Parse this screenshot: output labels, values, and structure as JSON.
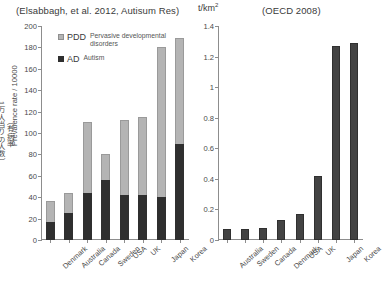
{
  "left": {
    "title": "(Elsabbagh, et al. 2012, Autisum Res)",
    "y_axis_label_en": "Prevalence rate / 10000",
    "y_axis_label_ja_1": "（有病率",
    "y_axis_label_ja_2": "1万人当りの人数）",
    "legend": [
      {
        "key": "PDD",
        "desc": "Pervasive developmental disorders",
        "color": "#b4b4b4"
      },
      {
        "key": "AD",
        "desc": "Autism",
        "color": "#2f2f2f"
      }
    ]
  },
  "right": {
    "title": "(OECD 2008)",
    "unit": "t/km2"
  },
  "chart_data": [
    {
      "type": "bar",
      "id": "prevalence",
      "title": "(Elsabbagh, et al. 2012, Autisum Res)",
      "xlabel": "",
      "ylabel": "Prevalence rate / 10000",
      "ylim": [
        0,
        200
      ],
      "yticks": [
        0,
        20,
        40,
        60,
        80,
        100,
        120,
        140,
        160,
        180,
        200
      ],
      "grid": false,
      "stacked": true,
      "legend_position": "top-left",
      "categories": [
        "Denmark",
        "Australia",
        "Canada",
        "Sweden",
        "USA",
        "UK",
        "Japan",
        "Korea"
      ],
      "series": [
        {
          "name": "AD",
          "label": "Autism",
          "color": "#2f2f2f",
          "values": [
            17,
            25,
            44,
            56,
            42,
            42,
            40,
            90
          ]
        },
        {
          "name": "PDD",
          "label": "Pervasive developmental disorders",
          "color": "#b4b4b4",
          "values": [
            19,
            19,
            66,
            24,
            70,
            73,
            140,
            99
          ]
        }
      ],
      "totals": [
        36,
        44,
        110,
        80,
        112,
        115,
        180,
        189
      ]
    },
    {
      "type": "bar",
      "id": "oecd-intensity",
      "title": "(OECD 2008)",
      "xlabel": "",
      "ylabel": "t/km2",
      "ylim": [
        0,
        1.4
      ],
      "yticks": [
        0,
        0.2,
        0.4,
        0.6,
        0.8,
        1,
        1.2,
        1.4
      ],
      "grid": false,
      "legend_position": "none",
      "categories": [
        "Australia",
        "Sweden",
        "Canada",
        "Denmark",
        "USA",
        "UK",
        "Japan",
        "Korea"
      ],
      "values": [
        0.07,
        0.07,
        0.08,
        0.13,
        0.17,
        0.42,
        1.27,
        1.29
      ],
      "color": "#434343"
    }
  ]
}
